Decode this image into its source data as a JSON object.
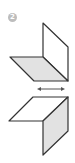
{
  "step_badge": {
    "label": "2",
    "color": "#bdbdbd"
  },
  "colors": {
    "stroke": "#333333",
    "fill_shaded": "#e2e2e2",
    "fill_plain": "#ffffff",
    "arrow": "#555555"
  },
  "figures": {
    "top": {
      "description": "folded sheet with vertical back panel and shaded floor",
      "back_panel": [
        [
          43,
          23
        ],
        [
          68,
          47
        ],
        [
          68,
          81
        ],
        [
          43,
          57
        ]
      ],
      "floor": [
        [
          10,
          57
        ],
        [
          43,
          57
        ],
        [
          68,
          81
        ],
        [
          34,
          81
        ]
      ]
    },
    "arrow": {
      "x1": 38,
      "x2": 64,
      "y": 89,
      "type": "double-headed"
    },
    "bottom": {
      "description": "folded sheet with top panel and shaded vertical side",
      "top_panel": [
        [
          33,
          97
        ],
        [
          68,
          97
        ],
        [
          43,
          121
        ],
        [
          9,
          121
        ]
      ],
      "side_panel": [
        [
          43,
          121
        ],
        [
          68,
          97
        ],
        [
          68,
          131
        ],
        [
          43,
          155
        ]
      ]
    }
  }
}
